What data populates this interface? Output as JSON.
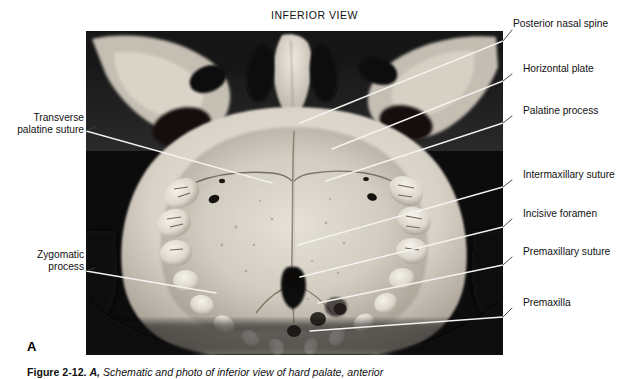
{
  "figure": {
    "view_title": "INFERIOR VIEW",
    "panel_letter": "A",
    "caption_figure_number": "Figure 2-12.",
    "caption_panel": "A,",
    "caption_text": "Schematic and photo of inferior view of hard palate, anterior"
  },
  "photo": {
    "alt_name": "hard-palate-inferior-view-photograph",
    "background_color": "#0b0b0b",
    "bone_color": "#ded9d0"
  },
  "labels_left": [
    {
      "id": "transverse-palatine-suture",
      "text": "Transverse\npalatine suture"
    },
    {
      "id": "zygomatic-process",
      "text": "Zygomatic\nprocess"
    }
  ],
  "labels_right": [
    {
      "id": "posterior-nasal-spine",
      "text": "Posterior nasal spine"
    },
    {
      "id": "horizontal-plate",
      "text": "Horizontal plate"
    },
    {
      "id": "palatine-process",
      "text": "Palatine process"
    },
    {
      "id": "intermaxillary-suture",
      "text": "Intermaxillary suture"
    },
    {
      "id": "incisive-foramen",
      "text": "Incisive foramen"
    },
    {
      "id": "premaxillary-suture",
      "text": "Premaxillary suture"
    },
    {
      "id": "premaxilla",
      "text": "Premaxilla"
    }
  ],
  "colors": {
    "leader_inner": "#f2f2f2",
    "leader_outer": "#3a3a3a",
    "text": "#111111",
    "page_background": "#ffffff"
  }
}
